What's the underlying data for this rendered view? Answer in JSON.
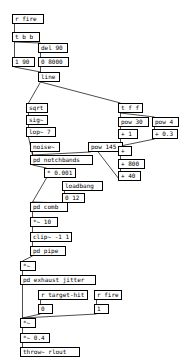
{
  "patch": {
    "title": "pd patch — rocket/exhaust sound synthesis",
    "background": "#ffffff",
    "line_color": "#000000",
    "objects": [
      {
        "id": "r_fire",
        "label": "r fire",
        "kind": "object",
        "x": 12,
        "y": 14,
        "w": 32
      },
      {
        "id": "t_b_b",
        "label": "t b b",
        "kind": "object",
        "x": 12,
        "y": 32,
        "w": 28
      },
      {
        "id": "del90",
        "label": "del 90",
        "kind": "object",
        "x": 38,
        "y": 43,
        "w": 30
      },
      {
        "id": "msg_1_90",
        "label": "1 90",
        "kind": "message",
        "x": 12,
        "y": 57,
        "w": 23
      },
      {
        "id": "msg_0_8000",
        "label": "0 8000",
        "kind": "message",
        "x": 38,
        "y": 57,
        "w": 31
      },
      {
        "id": "line",
        "label": "line",
        "kind": "object",
        "x": 38,
        "y": 72,
        "w": 22
      },
      {
        "id": "sqrt",
        "label": "sqrt",
        "kind": "object",
        "x": 26,
        "y": 103,
        "w": 22
      },
      {
        "id": "sig",
        "label": "sig~",
        "kind": "object",
        "x": 26,
        "y": 115,
        "w": 22
      },
      {
        "id": "lop",
        "label": "lop~ 7",
        "kind": "object",
        "x": 26,
        "y": 127,
        "w": 30
      },
      {
        "id": "noise",
        "label": "noise~",
        "kind": "object",
        "x": 30,
        "y": 142,
        "w": 30
      },
      {
        "id": "pow145",
        "label": "pow 145",
        "kind": "object",
        "x": 88,
        "y": 142,
        "w": 35
      },
      {
        "id": "pd_notchbands",
        "label": "pd notchbands",
        "kind": "object",
        "x": 30,
        "y": 155,
        "w": 63
      },
      {
        "id": "mul0001",
        "label": "* 0.001",
        "kind": "object",
        "x": 44,
        "y": 168,
        "w": 32
      },
      {
        "id": "loadbang",
        "label": "loadbang",
        "kind": "object",
        "x": 62,
        "y": 181,
        "w": 41
      },
      {
        "id": "msg_0_12",
        "label": "0 12",
        "kind": "message",
        "x": 62,
        "y": 193,
        "w": 23
      },
      {
        "id": "pd_comb",
        "label": "pd comb",
        "kind": "object",
        "x": 30,
        "y": 202,
        "w": 38
      },
      {
        "id": "mul10",
        "label": "*~ 10",
        "kind": "object",
        "x": 30,
        "y": 217,
        "w": 28
      },
      {
        "id": "clip",
        "label": "clip~ -1 1",
        "kind": "object",
        "x": 30,
        "y": 232,
        "w": 42
      },
      {
        "id": "pd_pipe",
        "label": "pd pipe",
        "kind": "object",
        "x": 30,
        "y": 246,
        "w": 36
      },
      {
        "id": "t_f_f",
        "label": "t f f",
        "kind": "object",
        "x": 118,
        "y": 103,
        "w": 25
      },
      {
        "id": "pow30",
        "label": "pow 30",
        "kind": "object",
        "x": 118,
        "y": 117,
        "w": 31
      },
      {
        "id": "pow4",
        "label": "pow 4",
        "kind": "object",
        "x": 152,
        "y": 117,
        "w": 27
      },
      {
        "id": "plus1",
        "label": "+ 1",
        "kind": "object",
        "x": 118,
        "y": 129,
        "w": 20
      },
      {
        "id": "plus03",
        "label": "+ 0.3",
        "kind": "object",
        "x": 152,
        "y": 129,
        "w": 26
      },
      {
        "id": "plus_empty",
        "label": "+",
        "kind": "object",
        "x": 118,
        "y": 146,
        "w": 14
      },
      {
        "id": "plus800",
        "label": "+ 800",
        "kind": "object",
        "x": 118,
        "y": 159,
        "w": 27
      },
      {
        "id": "plus40",
        "label": "+ 40",
        "kind": "object",
        "x": 118,
        "y": 171,
        "w": 23
      },
      {
        "id": "mul_a",
        "label": "*~",
        "kind": "object",
        "x": 20,
        "y": 261,
        "w": 16
      },
      {
        "id": "pd_exhaust",
        "label": "pd exhaust jitter",
        "kind": "object",
        "x": 20,
        "y": 275,
        "w": 76
      },
      {
        "id": "r_target_hit",
        "label": "r target-hit",
        "kind": "object",
        "x": 38,
        "y": 290,
        "w": 50
      },
      {
        "id": "r_fire2",
        "label": "r fire",
        "kind": "object",
        "x": 94,
        "y": 290,
        "w": 28
      },
      {
        "id": "msg_0",
        "label": "0",
        "kind": "message",
        "x": 38,
        "y": 304,
        "w": 15
      },
      {
        "id": "msg_1",
        "label": "1",
        "kind": "message",
        "x": 94,
        "y": 304,
        "w": 15
      },
      {
        "id": "mul_b",
        "label": "*~",
        "kind": "object",
        "x": 20,
        "y": 318,
        "w": 16
      },
      {
        "id": "mul04",
        "label": "*~ 0.4",
        "kind": "object",
        "x": 20,
        "y": 333,
        "w": 30
      },
      {
        "id": "throw",
        "label": "throw~ rlout",
        "kind": "object",
        "x": 20,
        "y": 347,
        "w": 60
      }
    ],
    "connections": [
      {
        "from": "r_fire",
        "to": "t_b_b"
      },
      {
        "from": "t_b_b",
        "to": "msg_1_90"
      },
      {
        "from": "t_b_b",
        "to": "del90"
      },
      {
        "from": "del90",
        "to": "msg_0_8000"
      },
      {
        "from": "msg_1_90",
        "to": "line"
      },
      {
        "from": "msg_0_8000",
        "to": "line"
      },
      {
        "from": "line",
        "to": "sqrt"
      },
      {
        "from": "line",
        "to": "t_f_f"
      },
      {
        "from": "sqrt",
        "to": "sig"
      },
      {
        "from": "sig",
        "to": "lop"
      },
      {
        "from": "lop",
        "to": "pd_notchbands"
      },
      {
        "from": "noise",
        "to": "pd_notchbands"
      },
      {
        "from": "pow145",
        "to": "pd_notchbands"
      },
      {
        "from": "pd_notchbands",
        "to": "mul0001"
      },
      {
        "from": "mul0001",
        "to": "pd_comb"
      },
      {
        "from": "loadbang",
        "to": "msg_0_12"
      },
      {
        "from": "msg_0_12",
        "to": "pd_comb"
      },
      {
        "from": "pd_comb",
        "to": "mul10"
      },
      {
        "from": "mul10",
        "to": "clip"
      },
      {
        "from": "clip",
        "to": "pd_pipe"
      },
      {
        "from": "pd_pipe",
        "to": "mul_a"
      },
      {
        "from": "t_f_f",
        "to": "pow30"
      },
      {
        "from": "t_f_f",
        "to": "pow4"
      },
      {
        "from": "pow30",
        "to": "plus1"
      },
      {
        "from": "pow4",
        "to": "plus03"
      },
      {
        "from": "plus1",
        "to": "plus_empty"
      },
      {
        "from": "plus03",
        "to": "plus_empty"
      },
      {
        "from": "plus_empty",
        "to": "plus800"
      },
      {
        "from": "plus800",
        "to": "plus40"
      },
      {
        "from": "plus40",
        "to": "pow145"
      },
      {
        "from": "mul_a",
        "to": "pd_exhaust"
      },
      {
        "from": "pd_exhaust",
        "to": "mul_b"
      },
      {
        "from": "r_target_hit",
        "to": "msg_0"
      },
      {
        "from": "r_fire2",
        "to": "msg_1"
      },
      {
        "from": "msg_0",
        "to": "mul_b"
      },
      {
        "from": "msg_1",
        "to": "mul_b"
      },
      {
        "from": "mul_b",
        "to": "mul04"
      },
      {
        "from": "mul04",
        "to": "throw"
      }
    ]
  }
}
